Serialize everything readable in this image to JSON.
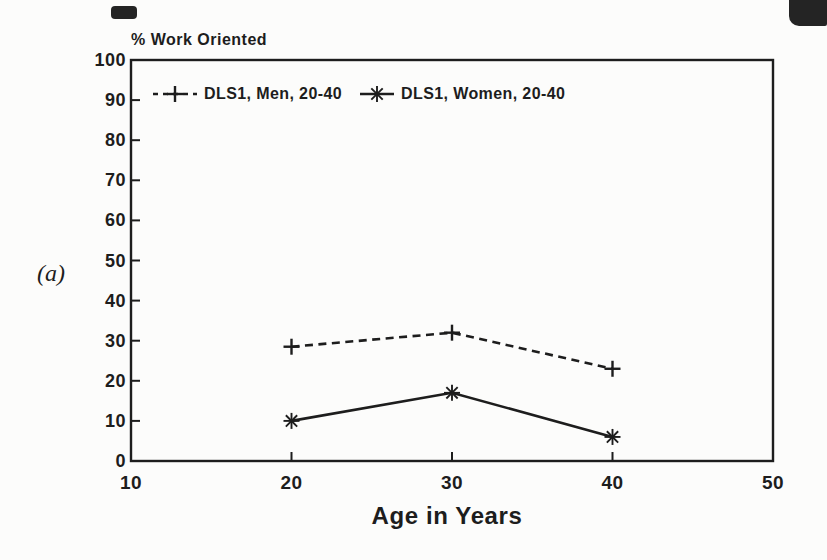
{
  "panel_label": "(a)",
  "chart_data": {
    "type": "line",
    "title": "% Work Oriented",
    "xlabel": "Age in Years",
    "ylabel": "% Work Oriented",
    "x": [
      20,
      30,
      40
    ],
    "series": [
      {
        "name": "DLS1, Men, 20-40",
        "marker": "plus",
        "line_style": "dashed",
        "values": [
          28.5,
          32,
          23
        ]
      },
      {
        "name": "DLS1, Women, 20-40",
        "marker": "asterisk",
        "line_style": "solid",
        "values": [
          10,
          17,
          6
        ]
      }
    ],
    "xlim": [
      10,
      50
    ],
    "ylim": [
      0,
      100
    ],
    "xticks": [
      10,
      20,
      30,
      40,
      50
    ],
    "yticks": [
      0,
      10,
      20,
      30,
      40,
      50,
      60,
      70,
      80,
      90,
      100
    ],
    "grid": false,
    "legend_position": "top-inside",
    "ink_color": "#1d1d1d",
    "paper_color": "#fcfcfb"
  }
}
